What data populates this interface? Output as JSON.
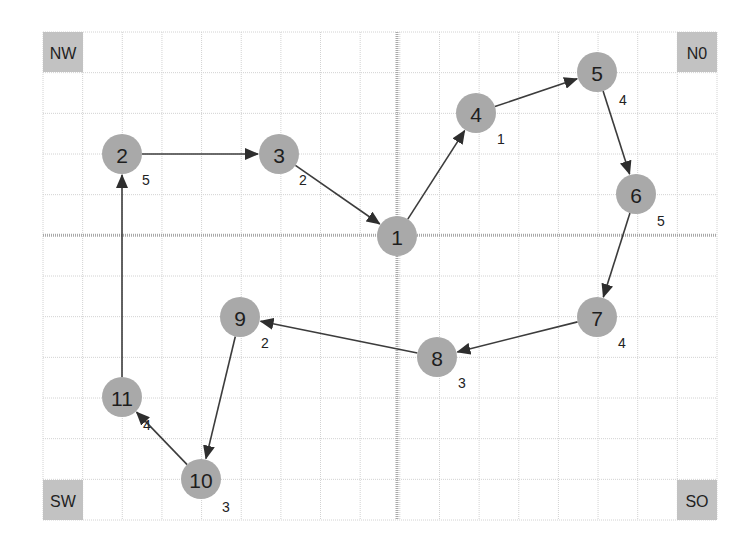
{
  "canvas": {
    "width": 752,
    "height": 544
  },
  "grid": {
    "left": 43,
    "top": 32,
    "right": 717,
    "bottom": 520,
    "cols": 17,
    "rows": 12,
    "axis_col": 9,
    "axis_row": 5,
    "colors": {
      "grid": "#d2d2d2",
      "axis": "#a8a8a8"
    }
  },
  "corners": [
    {
      "id": "nw",
      "label": "NW",
      "x": 43,
      "y": 32,
      "w": 40,
      "h": 40
    },
    {
      "id": "no",
      "label": "N0",
      "x": 677,
      "y": 32,
      "w": 40,
      "h": 40
    },
    {
      "id": "sw",
      "label": "SW",
      "x": 43,
      "y": 480,
      "w": 40,
      "h": 40
    },
    {
      "id": "so",
      "label": "SO",
      "x": 677,
      "y": 480,
      "w": 40,
      "h": 40
    }
  ],
  "nodes": [
    {
      "id": "1",
      "label": "1",
      "x": 397,
      "y": 236
    },
    {
      "id": "2",
      "label": "2",
      "x": 122,
      "y": 154
    },
    {
      "id": "3",
      "label": "3",
      "x": 279,
      "y": 154
    },
    {
      "id": "4",
      "label": "4",
      "x": 476,
      "y": 113
    },
    {
      "id": "5",
      "label": "5",
      "x": 597,
      "y": 72
    },
    {
      "id": "6",
      "label": "6",
      "x": 636,
      "y": 194
    },
    {
      "id": "7",
      "label": "7",
      "x": 597,
      "y": 317
    },
    {
      "id": "8",
      "label": "8",
      "x": 437,
      "y": 357
    },
    {
      "id": "9",
      "label": "9",
      "x": 240,
      "y": 317
    },
    {
      "id": "10",
      "label": "10",
      "x": 201,
      "y": 479
    },
    {
      "id": "11",
      "label": "11",
      "x": 122,
      "y": 397
    }
  ],
  "node_style": {
    "radius": 20,
    "fill": "#a9a9a9",
    "text": "#1e1e1e"
  },
  "weights": [
    {
      "node": "2",
      "label": "5",
      "x": 146,
      "y": 180
    },
    {
      "node": "3",
      "label": "2",
      "x": 303,
      "y": 180
    },
    {
      "node": "4",
      "label": "1",
      "x": 501,
      "y": 139
    },
    {
      "node": "5",
      "label": "4",
      "x": 623,
      "y": 100
    },
    {
      "node": "6",
      "label": "5",
      "x": 661,
      "y": 221
    },
    {
      "node": "7",
      "label": "4",
      "x": 622,
      "y": 343
    },
    {
      "node": "8",
      "label": "3",
      "x": 462,
      "y": 383
    },
    {
      "node": "9",
      "label": "2",
      "x": 265,
      "y": 343
    },
    {
      "node": "10",
      "label": "3",
      "x": 226,
      "y": 507
    },
    {
      "node": "11",
      "label": "4",
      "x": 147,
      "y": 425
    }
  ],
  "edges": [
    {
      "from": "2",
      "to": "3"
    },
    {
      "from": "3",
      "to": "1"
    },
    {
      "from": "1",
      "to": "4"
    },
    {
      "from": "4",
      "to": "5"
    },
    {
      "from": "5",
      "to": "6"
    },
    {
      "from": "6",
      "to": "7"
    },
    {
      "from": "7",
      "to": "8"
    },
    {
      "from": "8",
      "to": "9"
    },
    {
      "from": "9",
      "to": "10"
    },
    {
      "from": "10",
      "to": "11"
    },
    {
      "from": "11",
      "to": "2"
    }
  ],
  "edge_style": {
    "color": "#3c3c3c"
  }
}
